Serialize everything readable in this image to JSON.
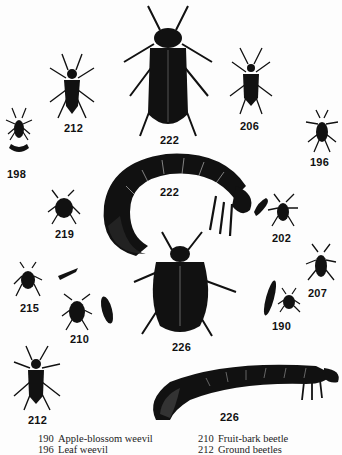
{
  "figures": [
    {
      "id": "198",
      "label": "198"
    },
    {
      "id": "212a",
      "label": "212"
    },
    {
      "id": "222a",
      "label": "222"
    },
    {
      "id": "206",
      "label": "206"
    },
    {
      "id": "196",
      "label": "196"
    },
    {
      "id": "222b",
      "label": "222"
    },
    {
      "id": "219",
      "label": "219"
    },
    {
      "id": "202",
      "label": "202"
    },
    {
      "id": "207",
      "label": "207"
    },
    {
      "id": "215",
      "label": "215"
    },
    {
      "id": "210",
      "label": "210"
    },
    {
      "id": "226a",
      "label": "226"
    },
    {
      "id": "190",
      "label": "190"
    },
    {
      "id": "212b",
      "label": "212"
    },
    {
      "id": "226b",
      "label": "226"
    }
  ],
  "caption": {
    "left": [
      {
        "num": "190",
        "name": "Apple-blossom weevil"
      },
      {
        "num": "196",
        "name": "Leaf weevil"
      }
    ],
    "right": [
      {
        "num": "210",
        "name": "Fruit-bark beetle"
      },
      {
        "num": "212",
        "name": "Ground beetles"
      }
    ]
  },
  "colors": {
    "ink": "#111111",
    "paper": "#fdfdfd"
  }
}
